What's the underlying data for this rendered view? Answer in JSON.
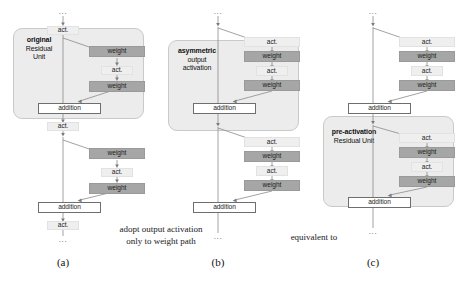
{
  "figure": {
    "labels": {
      "act": "act.",
      "weight": "weight",
      "addition": "addition",
      "ellipsis": "..."
    },
    "panels": [
      {
        "id": "a",
        "caption": "(a)",
        "group_label_bold": "original",
        "group_label_rest": "Residual\nUnit",
        "group_label_full": "original Residual Unit",
        "nodes": [
          {
            "name": "top-ellipsis",
            "text": "...",
            "type": "ellipsis"
          },
          {
            "name": "spine-act-top",
            "text": "act.",
            "type": "act"
          },
          {
            "name": "unit1-weight-1",
            "text": "weight",
            "type": "weight"
          },
          {
            "name": "unit1-act-mid",
            "text": "act.",
            "type": "act"
          },
          {
            "name": "unit1-weight-2",
            "text": "weight",
            "type": "weight"
          },
          {
            "name": "unit1-addition",
            "text": "addition",
            "type": "addition"
          },
          {
            "name": "spine-act-mid",
            "text": "act.",
            "type": "act"
          },
          {
            "name": "unit2-weight-1",
            "text": "weight",
            "type": "weight"
          },
          {
            "name": "unit2-act-mid",
            "text": "act.",
            "type": "act"
          },
          {
            "name": "unit2-weight-2",
            "text": "weight",
            "type": "weight"
          },
          {
            "name": "unit2-addition",
            "text": "addition",
            "type": "addition"
          },
          {
            "name": "spine-act-bottom",
            "text": "act.",
            "type": "act"
          },
          {
            "name": "bottom-ellipsis",
            "text": "...",
            "type": "ellipsis"
          }
        ]
      },
      {
        "id": "b",
        "caption": "(b)",
        "group_label_bold": "asymmetric",
        "group_label_rest": "output\nactivation",
        "group_label_full": "asymmetric output activation",
        "nodes": [
          {
            "name": "top-ellipsis",
            "text": "...",
            "type": "ellipsis"
          },
          {
            "name": "branch1-act-top",
            "text": "act.",
            "type": "act"
          },
          {
            "name": "branch1-weight-1",
            "text": "weight",
            "type": "weight"
          },
          {
            "name": "branch1-act-mid",
            "text": "act.",
            "type": "act"
          },
          {
            "name": "branch1-weight-2",
            "text": "weight",
            "type": "weight"
          },
          {
            "name": "unit1-addition",
            "text": "addition",
            "type": "addition"
          },
          {
            "name": "branch2-act-top",
            "text": "act.",
            "type": "act"
          },
          {
            "name": "branch2-weight-1",
            "text": "weight",
            "type": "weight"
          },
          {
            "name": "branch2-act-mid",
            "text": "act.",
            "type": "act"
          },
          {
            "name": "branch2-weight-2",
            "text": "weight",
            "type": "weight"
          },
          {
            "name": "unit2-addition",
            "text": "addition",
            "type": "addition"
          },
          {
            "name": "bottom-ellipsis",
            "text": "...",
            "type": "ellipsis"
          }
        ]
      },
      {
        "id": "c",
        "caption": "(c)",
        "group_label_bold": "pre-activation",
        "group_label_rest": "Residual Unit",
        "group_label_full": "pre-activation Residual Unit",
        "nodes": [
          {
            "name": "top-ellipsis",
            "text": "...",
            "type": "ellipsis"
          },
          {
            "name": "branch1-act-top",
            "text": "act.",
            "type": "act"
          },
          {
            "name": "branch1-weight-1",
            "text": "weight",
            "type": "weight"
          },
          {
            "name": "branch1-act-mid",
            "text": "act.",
            "type": "act"
          },
          {
            "name": "branch1-weight-2",
            "text": "weight",
            "type": "weight"
          },
          {
            "name": "unit1-addition",
            "text": "addition",
            "type": "addition"
          },
          {
            "name": "branch2-act-top",
            "text": "act.",
            "type": "act"
          },
          {
            "name": "branch2-weight-1",
            "text": "weight",
            "type": "weight"
          },
          {
            "name": "branch2-act-mid",
            "text": "act.",
            "type": "act"
          },
          {
            "name": "branch2-weight-2",
            "text": "weight",
            "type": "weight"
          },
          {
            "name": "unit2-addition",
            "text": "addition",
            "type": "addition"
          },
          {
            "name": "bottom-ellipsis",
            "text": "...",
            "type": "ellipsis"
          }
        ]
      }
    ],
    "between_captions": [
      {
        "name": "caption-a-to-b",
        "text": "adopt output activation\nonly to weight path"
      },
      {
        "name": "caption-b-to-c",
        "text": "equivalent to"
      }
    ],
    "colors": {
      "weight_fill": "#a6a6a6",
      "act_fill": "#efefef",
      "addition_fill": "#ffffff",
      "group_fill": "#ececec",
      "group_border": "#c9c9c9",
      "wire": "#8a8a8a",
      "background": "#ffffff"
    }
  }
}
